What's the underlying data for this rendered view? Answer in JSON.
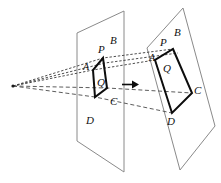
{
  "figure": {
    "colors": {
      "plane_stroke": "#8a8a8a",
      "quad_stroke": "#0d0d0d",
      "ray_stroke": "#4a4a4a",
      "arrow": "#0d0d0d",
      "background": "#ffffff"
    },
    "left_plane": {
      "name": "left-plane",
      "labels": {
        "P": "P",
        "A": "A",
        "B": "B",
        "Q": "Q",
        "C": "C",
        "D": "D"
      }
    },
    "right_plane": {
      "name": "right-plane",
      "labels": {
        "P": "P",
        "A": "A",
        "B": "B",
        "Q": "Q",
        "C": "C",
        "D": "D"
      }
    },
    "arrow": {
      "name": "transfer-arrow",
      "direction": "right"
    },
    "apex": {
      "name": "projection-apex",
      "label": ""
    }
  }
}
